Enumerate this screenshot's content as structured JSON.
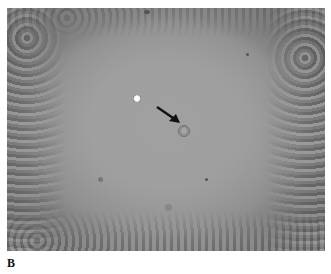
{
  "figure": {
    "panel_label": "B",
    "image_description": "Phase-contrast micrograph showing a cleared central region surrounded by dense cells at the edges; a single cell in the center is marked by a black arrow, with a bright refractile cell to its upper left.",
    "annotations": [
      {
        "type": "arrow",
        "color": "#111111",
        "points_to": "target-cell"
      }
    ],
    "colors": {
      "background": "#ffffff",
      "micrograph_center": "#a0a0a0",
      "micrograph_edges": "#5a5a5a",
      "arrow": "#111111"
    }
  }
}
